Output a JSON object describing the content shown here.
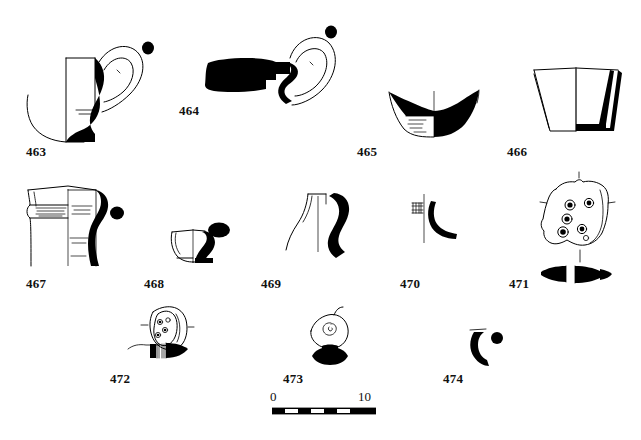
{
  "plate": {
    "type": "archaeological-pottery-illustration-plate",
    "background_color": "#ffffff",
    "ink_color": "#000000",
    "width": 641,
    "height": 440
  },
  "figures": [
    {
      "id": "463",
      "label": "463",
      "label_x": 26,
      "label_y": 145,
      "description": "handled cup, profile with section, loop handle and dot"
    },
    {
      "id": "464",
      "label": "464",
      "label_x": 179,
      "label_y": 104,
      "description": "rim and body sherd, solid black, with handle profile, loop outline and dot"
    },
    {
      "id": "465",
      "label": "465",
      "label_x": 357,
      "label_y": 145,
      "description": "shallow bowl, half section with interior hatching"
    },
    {
      "id": "466",
      "label": "466",
      "label_x": 507,
      "label_y": 145,
      "description": "truncated conical cup, half section"
    },
    {
      "id": "467",
      "label": "467",
      "label_x": 26,
      "label_y": 277,
      "description": "jar neck and shoulder with incised decoration and handle profile with dot"
    },
    {
      "id": "468",
      "label": "468",
      "label_x": 144,
      "label_y": 277,
      "description": "small base sherd with handle profile and oval dot"
    },
    {
      "id": "469",
      "label": "469",
      "label_x": 261,
      "label_y": 277,
      "description": "narrow-necked jar profile with handle section"
    },
    {
      "id": "470",
      "label": "470",
      "label_x": 400,
      "label_y": 277,
      "description": "small rim sherd with hatching and handle section"
    },
    {
      "id": "471",
      "label": "471",
      "label_x": 509,
      "label_y": 277,
      "description": "perforated sherd (strainer) with five holes and profile section"
    },
    {
      "id": "472",
      "label": "472",
      "label_x": 110,
      "label_y": 372,
      "description": "decorated handle fragment with punctate motif and profile section"
    },
    {
      "id": "473",
      "label": "473",
      "label_x": 283,
      "label_y": 372,
      "description": "small spiral-decorated object with black profile section"
    },
    {
      "id": "474",
      "label": "474",
      "label_x": 443,
      "label_y": 372,
      "description": "small crescent handle fragment with dot"
    }
  ],
  "scale": {
    "start_label": "0",
    "end_label": "10",
    "start_label_x": 270,
    "start_label_y": 390,
    "end_label_x": 358,
    "end_label_y": 390,
    "bar_x": 272,
    "bar_y": 408,
    "bar_width": 104,
    "bar_height": 6,
    "segments": 8,
    "unit": "cm"
  }
}
